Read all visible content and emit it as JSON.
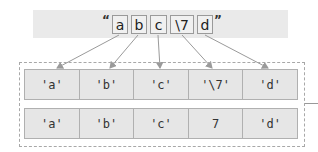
{
  "source_string": {
    "open_quote": "“",
    "close_quote": "”",
    "chars": [
      "a",
      "b",
      "c",
      "\\7",
      "d"
    ]
  },
  "parsed_rows": [
    {
      "cells": [
        "'a'",
        "'b'",
        "'c'",
        "'\\7'",
        "'d'"
      ]
    },
    {
      "cells": [
        "'a'",
        "'b'",
        "'c'",
        "7",
        "'d'"
      ]
    }
  ],
  "colors": {
    "bar_bg": "#eaeaea",
    "cell_bg": "#e6e6e6",
    "border": "#b0b0b0",
    "arrow": "#9a9a9a"
  }
}
